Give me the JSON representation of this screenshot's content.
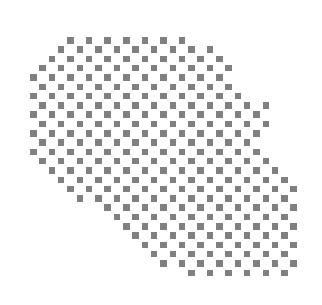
{
  "figure": {
    "kind": "dot-matrix-map",
    "title": "",
    "background_color": "#ffffff",
    "dot_color": "#808080",
    "canvas": {
      "width": 322,
      "height": 305
    }
  },
  "grid": {
    "origin_x": 30,
    "origin_y": 37,
    "pitch_x": 9.3,
    "pitch_y": 9.3,
    "dot_size": 6.5,
    "columns": 29,
    "rows": 26,
    "checker_parity": 0,
    "note": "Each row mask lists the inclusive [start,end] column spans covered by the landmass; dots are drawn only where (col+row) matches the checker parity."
  },
  "chart_data": {
    "type": "heatmap",
    "title": "",
    "xlabel": "",
    "ylabel": "",
    "legend": [],
    "row_spans": [
      [
        [
          4,
          17
        ]
      ],
      [
        [
          2,
          19
        ]
      ],
      [
        [
          1,
          20
        ]
      ],
      [
        [
          1,
          21
        ]
      ],
      [
        [
          0,
          21
        ]
      ],
      [
        [
          0,
          22
        ]
      ],
      [
        [
          0,
          23
        ]
      ],
      [
        [
          0,
          25
        ]
      ],
      [
        [
          0,
          25
        ]
      ],
      [
        [
          0,
          25
        ]
      ],
      [
        [
          0,
          24
        ]
      ],
      [
        [
          0,
          24
        ]
      ],
      [
        [
          0,
          25
        ]
      ],
      [
        [
          1,
          26
        ]
      ],
      [
        [
          1,
          27
        ]
      ],
      [
        [
          2,
          28
        ]
      ],
      [
        [
          3,
          28
        ]
      ],
      [
        [
          5,
          28
        ]
      ],
      [
        [
          7,
          28
        ]
      ],
      [
        [
          8,
          28
        ]
      ],
      [
        [
          9,
          28
        ]
      ],
      [
        [
          10,
          28
        ]
      ],
      [
        [
          11,
          28
        ]
      ],
      [
        [
          12,
          28
        ]
      ],
      [
        [
          14,
          28
        ]
      ],
      [
        [
          17,
          28
        ]
      ]
    ]
  }
}
